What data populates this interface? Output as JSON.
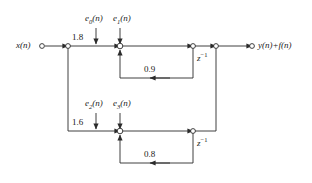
{
  "figure": {
    "type": "signal-flow-graph"
  },
  "signals": {
    "input_label": "x(n)",
    "output_label": "y(n)+f(n)"
  },
  "errors": {
    "e0": "e",
    "e0_sub": "0",
    "e0_arg": "(n)",
    "e1": "e",
    "e1_sub": "1",
    "e1_arg": "(n)",
    "e2": "e",
    "e2_sub": "2",
    "e2_arg": "(n)",
    "e3": "e",
    "e3_sub": "3",
    "e3_arg": "(n)"
  },
  "gains": {
    "input_gain_top": "1.8",
    "feedback_gain_top": "0.9",
    "input_gain_bottom": "1.6",
    "feedback_gain_bottom": "0.8"
  },
  "delays": {
    "z_symbol": "z",
    "z_exponent": "−1",
    "top_label": "z",
    "bottom_label": "z"
  },
  "colors": {
    "line": "#2b2b2b",
    "text": "#1a1a1a",
    "node_fill": "#ffffff",
    "background": "#ffffff"
  }
}
